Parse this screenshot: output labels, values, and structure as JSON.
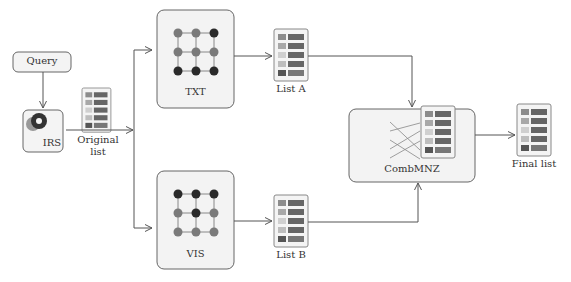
{
  "nodes": {
    "query": {
      "label": "Query"
    },
    "irs": {
      "label": "IRS"
    },
    "original_list": {
      "label_line1": "Original",
      "label_line2": "list"
    },
    "txt": {
      "label": "TXT"
    },
    "vis": {
      "label": "VIS"
    },
    "list_a": {
      "label": "List A"
    },
    "list_b": {
      "label": "List B"
    },
    "combmnz": {
      "label": "CombMNZ"
    },
    "final_list": {
      "label": "Final list"
    }
  },
  "colors": {
    "box_fill": "#f3f3f3",
    "box_stroke": "#666666",
    "node_dark": "#2a2a2a",
    "node_mid": "#7a7a7a",
    "list_dark": "#555555",
    "list_mid": "#8c8c8c",
    "list_light": "#bdbdbd",
    "irs_ring": "#333333",
    "irs_ring2": "#999999"
  }
}
